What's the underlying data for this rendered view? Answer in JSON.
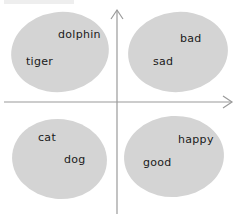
{
  "diagram": {
    "type": "quadrant-embedding-clusters",
    "colors": {
      "cluster_fill": "#d4d4d4",
      "axis": "#9a9a9a",
      "text": "#1a1a1a",
      "background": "#ffffff"
    },
    "clusters": [
      {
        "quadrant": "top-left",
        "words": [
          {
            "text": "dolphin",
            "x": 58,
            "y": 28
          },
          {
            "text": "tiger",
            "x": 26,
            "y": 55
          }
        ]
      },
      {
        "quadrant": "top-right",
        "words": [
          {
            "text": "bad",
            "x": 180,
            "y": 32
          },
          {
            "text": "sad",
            "x": 153,
            "y": 55
          }
        ]
      },
      {
        "quadrant": "bottom-left",
        "words": [
          {
            "text": "cat",
            "x": 38,
            "y": 131
          },
          {
            "text": "dog",
            "x": 64,
            "y": 153
          }
        ]
      },
      {
        "quadrant": "bottom-right",
        "words": [
          {
            "text": "happy",
            "x": 178,
            "y": 133
          },
          {
            "text": "good",
            "x": 143,
            "y": 156
          }
        ]
      }
    ]
  }
}
